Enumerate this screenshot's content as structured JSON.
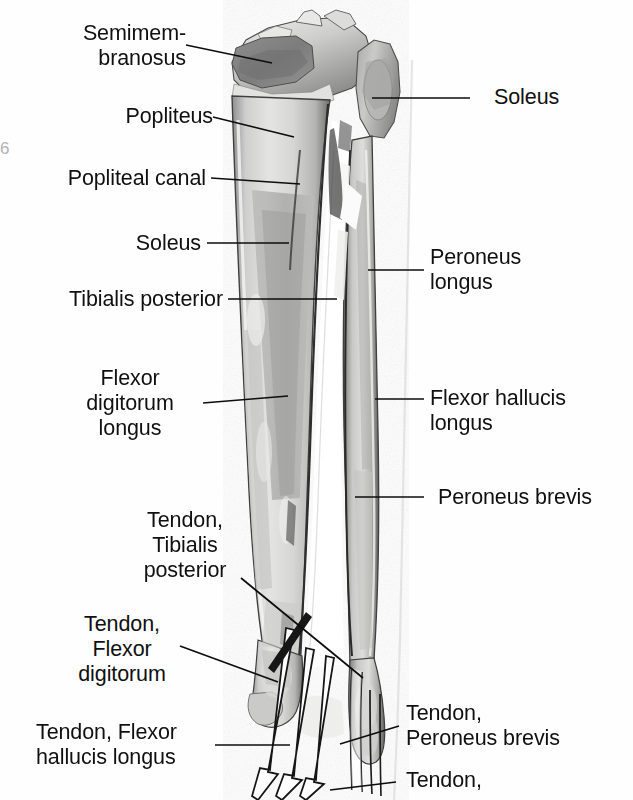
{
  "figure": {
    "kind": "anatomical-illustration",
    "background_color": "#fefefe",
    "ink_color": "#101010"
  },
  "edge_artifact": {
    "glyph": "6"
  },
  "labels": {
    "semimembranosus": {
      "text": "Semimem-\nbranosus",
      "align": "right"
    },
    "popliteus": {
      "text": "Popliteus",
      "align": "right"
    },
    "popliteal_canal": {
      "text": "Popliteal canal",
      "align": "right"
    },
    "soleus_left": {
      "text": "Soleus",
      "align": "right"
    },
    "tibialis_posterior": {
      "text": "Tibialis posterior",
      "align": "right"
    },
    "flexor_digitorum_longus": {
      "text": "Flexor\ndigitorum\nlongus",
      "align": "center"
    },
    "tendon_tibialis_posterior": {
      "text": "Tendon,\nTibialis\nposterior",
      "align": "center"
    },
    "tendon_flexor_digitorum": {
      "text": "Tendon,\nFlexor\ndigitorum",
      "align": "center"
    },
    "tendon_flexor_hallucis_longus": {
      "text": "Tendon, Flexor\nhallucis longus",
      "align": "left"
    },
    "soleus_right": {
      "text": "Soleus",
      "align": "left"
    },
    "peroneus_longus": {
      "text": "Peroneus\nlongus",
      "align": "left"
    },
    "flexor_hallucis_longus": {
      "text": "Flexor hallucis\nlongus",
      "align": "left"
    },
    "peroneus_brevis": {
      "text": "Peroneus brevis",
      "align": "left"
    },
    "tendon_peroneus_brevis": {
      "text": "Tendon,\nPeroneus brevis",
      "align": "left"
    },
    "tendon_clipped": {
      "text": "Tendon,",
      "align": "left"
    }
  }
}
